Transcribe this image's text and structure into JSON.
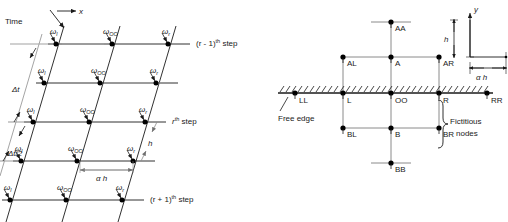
{
  "figure": {
    "left_diagram": {
      "name": "space-time-grid",
      "axis_time_label": "Time",
      "axis_x_label": "x",
      "interval_labels": [
        {
          "id": "dt",
          "text": "Δt"
        },
        {
          "id": "dt2",
          "text": "Δt/2"
        }
      ],
      "spacing_labels": [
        {
          "id": "h",
          "text": "h"
        },
        {
          "id": "alpha_h",
          "text": "α h"
        }
      ],
      "node_labels": {
        "left": "ω",
        "left_sub": "l",
        "center": "ω",
        "center_sub": "OO",
        "right": "ω",
        "right_sub": "r"
      },
      "step_labels": [
        {
          "id": "r-minus-1",
          "prefix": "(r - 1)",
          "sup": "th",
          "suffix": " step"
        },
        {
          "id": "r",
          "prefix": "r",
          "sup": "th",
          "suffix": " step"
        },
        {
          "id": "r-plus-1",
          "prefix": "(r + 1)",
          "sup": "th",
          "suffix": " step"
        }
      ],
      "rows": 5,
      "cols": 3
    },
    "right_diagram": {
      "name": "free-edge-node-stencil",
      "axis_y_label": "y",
      "dimension_labels": [
        {
          "id": "h",
          "text": "h"
        },
        {
          "id": "alpha_h",
          "text": "α h"
        }
      ],
      "free_edge_label": "Free edge",
      "fictitious_label_line1": "Fictitious",
      "fictitious_label_line2": "nodes",
      "nodes": [
        {
          "id": "AA",
          "label": "AA"
        },
        {
          "id": "AL",
          "label": "AL"
        },
        {
          "id": "A",
          "label": "A"
        },
        {
          "id": "AR",
          "label": "AR"
        },
        {
          "id": "LL",
          "label": "LL"
        },
        {
          "id": "L",
          "label": "L"
        },
        {
          "id": "OO",
          "label": "OO"
        },
        {
          "id": "R",
          "label": "R"
        },
        {
          "id": "RR",
          "label": "RR"
        },
        {
          "id": "BL",
          "label": "BL"
        },
        {
          "id": "B",
          "label": "B"
        },
        {
          "id": "BR",
          "label": "BR"
        },
        {
          "id": "BB",
          "label": "BB"
        }
      ]
    },
    "colors": {
      "line": "#1a1a1a",
      "grid_gray": "#8f8f8f",
      "node_fill": "#000000",
      "background": "#ffffff"
    }
  }
}
